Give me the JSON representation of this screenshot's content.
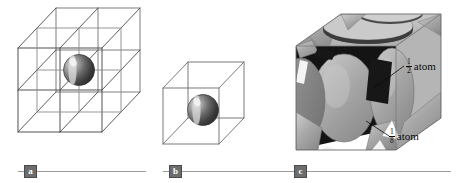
{
  "figure": {
    "background_color": "#ffffff",
    "width": 461,
    "height": 183
  },
  "panels": [
    {
      "id": "a",
      "label": "a",
      "description": "Two-by-two-by-two array of wireframe cubes with one shaded sphere at the shared corner",
      "cube_line_color": "#4a4a4a",
      "sphere_color": "#555555",
      "sphere_highlight_color": "#e8e8e8",
      "divisions": 2
    },
    {
      "id": "b",
      "label": "b",
      "description": "Single wireframe unit cell with shaded sphere at a face position",
      "cube_line_color": "#6b6b6b",
      "sphere_color": "#555555",
      "sphere_highlight_color": "#e0e0e0",
      "divisions": 1
    },
    {
      "id": "c",
      "label": "c",
      "description": "Solid face-centred cubic unit cell showing sliced atoms",
      "cube_face_color": "#a8a8a8",
      "cube_top_color": "#c4c4c4",
      "atom_color": "#9e9e9e",
      "interior_color": "#1a1a1a"
    }
  ],
  "callouts": [
    {
      "id": "half-atom",
      "numerator": "1",
      "denominator": "2",
      "text": "atom",
      "leader_from_x": 374,
      "leader_from_y": 88,
      "leader_to_x": 404,
      "leader_to_y": 66
    },
    {
      "id": "eighth-atom",
      "numerator": "1",
      "denominator": "8",
      "text": "atom",
      "leader_from_x": 366,
      "leader_from_y": 121,
      "leader_to_x": 389,
      "leader_to_y": 136
    }
  ],
  "caption_rules": [
    {
      "id": "rule-a",
      "label": "a",
      "left": 18,
      "top": 164,
      "width": 128
    },
    {
      "id": "rule-b",
      "label": "b",
      "left": 163,
      "top": 164,
      "width": 128
    },
    {
      "id": "rule-c",
      "label": "c",
      "left": 288,
      "top": 164,
      "width": 163
    }
  ],
  "colors": {
    "rule_line": "#9a9a9a",
    "badge_fill": "#6d6d6d",
    "badge_text": "#ffffff",
    "label_text": "#0a0a0a"
  }
}
